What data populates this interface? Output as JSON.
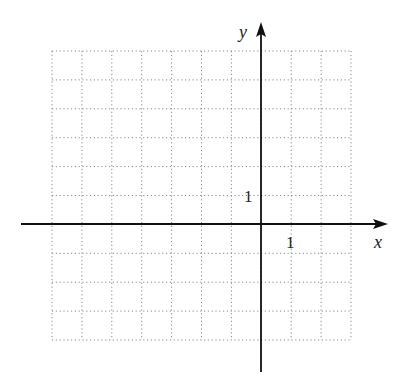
{
  "diagram": {
    "type": "coordinate_grid",
    "x_axis": {
      "label": "x",
      "tick_label": "1",
      "tick_value": 1,
      "range": [
        -7,
        3
      ]
    },
    "y_axis": {
      "label": "y",
      "tick_label": "1",
      "tick_value": 1,
      "range": [
        -4,
        6
      ]
    },
    "grid": {
      "columns": 10,
      "rows": 10,
      "line_style": "dotted",
      "line_color": "#8a8a8a"
    },
    "axis_color": "#111111"
  }
}
